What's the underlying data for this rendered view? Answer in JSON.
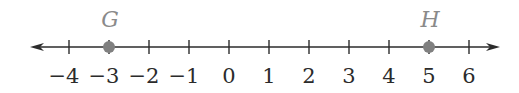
{
  "diagram": {
    "type": "number-line",
    "range": {
      "min": -4,
      "max": 6,
      "step": 1
    },
    "arrows": {
      "left": true,
      "right": true
    },
    "tick_labels": [
      "−4",
      "−3",
      "−2",
      "−1",
      "0",
      "1",
      "2",
      "3",
      "4",
      "5",
      "6"
    ],
    "tick_values": [
      -4,
      -3,
      -2,
      -1,
      0,
      1,
      2,
      3,
      4,
      5,
      6
    ],
    "points": [
      {
        "label": "G",
        "value": -3
      },
      {
        "label": "H",
        "value": 5
      }
    ],
    "colors": {
      "line": "#2b2b2b",
      "point": "#808080",
      "point_label": "#8a8a8a",
      "tick_label": "#2b2b2b"
    }
  }
}
